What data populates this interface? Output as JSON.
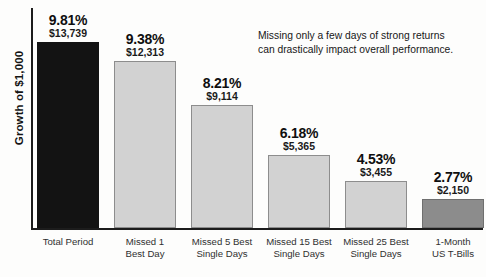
{
  "chart_data": {
    "type": "bar",
    "title": "",
    "subtitle": "",
    "xlabel": "",
    "ylabel": "Growth of $1,000",
    "ylim": [
      0,
      14500
    ],
    "grid": false,
    "legend": "none",
    "categories": [
      "Total Period",
      "Missed 1 Best Day",
      "Missed 5 Best Single Days",
      "Missed 15 Best Single Days",
      "Missed 25 Best Single Days",
      "1-Month US T-Bills"
    ],
    "category_lines": [
      [
        "Total Period",
        ""
      ],
      [
        "Missed 1",
        "Best Day"
      ],
      [
        "Missed 5 Best",
        "Single Days"
      ],
      [
        "Missed 15 Best",
        "Single Days"
      ],
      [
        "Missed 25 Best",
        "Single Days"
      ],
      [
        "1-Month",
        "US T-Bills"
      ]
    ],
    "values": [
      13739,
      12313,
      9114,
      5365,
      3455,
      2150
    ],
    "value_labels": [
      "$13,739",
      "$12,313",
      "$9,114",
      "$5,365",
      "$3,455",
      "$2,150"
    ],
    "percent_values": [
      9.81,
      9.38,
      8.21,
      6.18,
      4.53,
      2.77
    ],
    "percent_labels": [
      "9.81%",
      "9.38%",
      "8.21%",
      "6.18%",
      "4.53%",
      "2.77%"
    ],
    "bar_styles": [
      "dark",
      "light",
      "light",
      "light",
      "light",
      "medium"
    ],
    "annotation": [
      "Missing only a few days of strong returns",
      "can drastically impact overall performance."
    ],
    "colors": {
      "bar_dark": "#131313",
      "bar_light": "#d2d2d2",
      "bar_light_border": "#8d8d8d",
      "bar_medium": "#8c8c8c",
      "axis": "#1c1c1c",
      "text": "#1a1a1a",
      "background": "#fdfdfc"
    }
  }
}
